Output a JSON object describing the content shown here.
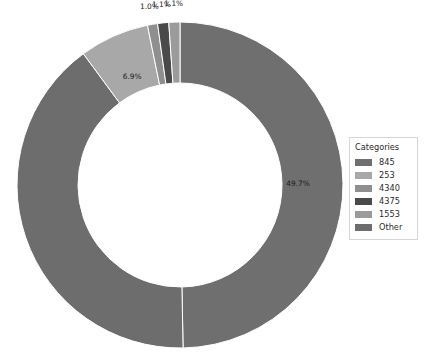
{
  "chart_data": {
    "type": "pie",
    "variant": "donut",
    "title": "",
    "xlabel": "",
    "ylabel": "",
    "legend_title": "Categories",
    "legend_position": "right",
    "grid": false,
    "start_angle_deg": 0,
    "direction": "clockwise",
    "inner_radius_ratio": 0.627,
    "categories": [
      "845",
      "253",
      "4340",
      "4375",
      "1553",
      "Other"
    ],
    "values": [
      49.7,
      40.2,
      6.9,
      1.0,
      1.1,
      1.1
    ],
    "labels": [
      "49.7%",
      "",
      "6.9%",
      "1.0%",
      "1.1%",
      "1.1%"
    ],
    "slices": [
      {
        "name": "845",
        "percent": 49.7,
        "label": "49.7%",
        "color": "#6f6f6f",
        "show_label": true
      },
      {
        "name": "Other",
        "percent": 40.2,
        "label": "",
        "color": "#6d6d6d",
        "show_label": false
      },
      {
        "name": "253",
        "percent": 6.9,
        "label": "6.9%",
        "color": "#a8a8a8",
        "show_label": true
      },
      {
        "name": "4340",
        "percent": 1.0,
        "label": "1.0%",
        "color": "#8f8f8f",
        "show_label": true
      },
      {
        "name": "4375",
        "percent": 1.1,
        "label": "1.1%",
        "color": "#4a4a4a",
        "show_label": true
      },
      {
        "name": "1553",
        "percent": 1.1,
        "label": "1.1%",
        "color": "#9b9b9b",
        "show_label": true
      }
    ]
  },
  "legend": {
    "title": "Categories",
    "items": [
      {
        "label": "845",
        "color": "#6f6f6f"
      },
      {
        "label": "253",
        "color": "#a8a8a8"
      },
      {
        "label": "4340",
        "color": "#8f8f8f"
      },
      {
        "label": "4375",
        "color": "#4a4a4a"
      },
      {
        "label": "1553",
        "color": "#9b9b9b"
      },
      {
        "label": "Other",
        "color": "#6d6d6d"
      }
    ]
  },
  "geometry": {
    "center_x": 180,
    "center_y": 185,
    "outer_radius": 163,
    "inner_radius": 102,
    "label_radius": 118
  },
  "colors": {
    "background": "#ffffff",
    "slice_edge": "#ffffff",
    "text": "#2a2a2a",
    "legend_border": "#d6d6d6"
  }
}
